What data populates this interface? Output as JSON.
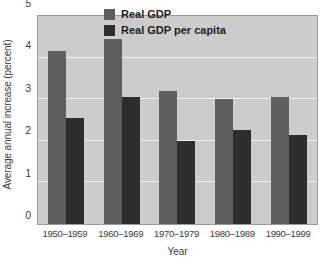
{
  "chart_data": {
    "type": "bar",
    "title": "",
    "xlabel": "Year",
    "ylabel": "Average annual increase (percent)",
    "categories": [
      "1950–1959",
      "1960–1969",
      "1970–1979",
      "1980–1989",
      "1990–1999"
    ],
    "series": [
      {
        "name": "Real GDP",
        "values": [
          4.15,
          4.45,
          3.2,
          3.0,
          3.05
        ],
        "color": "#5e5e5e"
      },
      {
        "name": "Real GDP per capita",
        "values": [
          2.55,
          3.05,
          2.0,
          2.25,
          2.15
        ],
        "color": "#2e2e2e"
      }
    ],
    "ylim": [
      0,
      5
    ],
    "yticks": [
      0,
      1,
      2,
      3,
      4,
      5
    ],
    "ytick_labels": [
      "0",
      "1",
      "2",
      "3",
      "4",
      "5"
    ],
    "grid": true,
    "legend_position": "top-center",
    "plot_background": "#cccccc",
    "gridline_color": "#f2f2f2",
    "figure_background": "#ffffff"
  }
}
